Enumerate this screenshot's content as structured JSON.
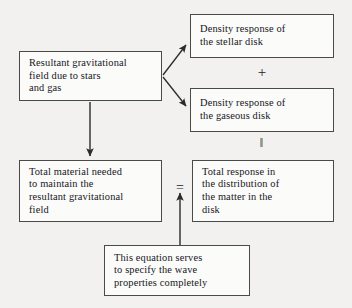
{
  "diagram": {
    "boxes": {
      "resultant_field": "Resultant gravitational\nfield due to stars\nand gas",
      "stellar_density": "Density response of\nthe stellar disk",
      "gaseous_density": "Density response of\nthe gaseous disk",
      "total_material": "Total material needed\nto maintain the\nresultant gravitational\nfield",
      "total_response": "Total response in\nthe distribution of\nthe matter in the\ndisk",
      "equation_note": "This equation serves\nto specify the wave\nproperties completely"
    },
    "operators": {
      "plus": "+",
      "double_bar": "‖",
      "equals": "="
    },
    "colors": {
      "background": "#f2f1ef",
      "box_fill": "#fbfbfa",
      "box_border": "#4a4a48",
      "text": "#16161a",
      "connector": "#2b2b2b"
    }
  }
}
